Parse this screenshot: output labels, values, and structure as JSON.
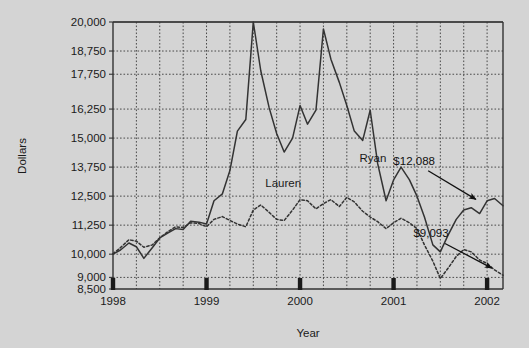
{
  "chart_data": {
    "type": "line",
    "title": "",
    "xlabel": "Year",
    "ylabel": "Dollars",
    "xlim": [
      1998.0,
      2002.17
    ],
    "ylim": [
      8500,
      20000
    ],
    "grid": true,
    "legend": "inline-labels",
    "y_ticks": [
      8500,
      9000,
      10000,
      11250,
      12500,
      13750,
      15000,
      16250,
      17750,
      18750,
      20000
    ],
    "y_tick_labels": [
      "8,500",
      "9,000",
      "10,000",
      "11,250",
      "12,500",
      "13,750",
      "15,000",
      "16,250",
      "17,750",
      "18,750",
      "20,000"
    ],
    "x_ticks": [
      1998,
      1999,
      2000,
      2001,
      2002
    ],
    "x_tick_labels": [
      "1998",
      "1999",
      "2000",
      "2001",
      "2002"
    ],
    "x_minor_interval": 0.25,
    "series": [
      {
        "name": "Ryan",
        "style": "solid",
        "color": "#333333",
        "label_x": 2000.78,
        "label_y": 13980,
        "end_value": 12088,
        "end_label": "$12,088",
        "x": [
          1998.0,
          1998.08,
          1998.17,
          1998.25,
          1998.33,
          1998.42,
          1998.5,
          1998.58,
          1998.67,
          1998.75,
          1998.83,
          1998.92,
          1999.0,
          1999.08,
          1999.17,
          1999.25,
          1999.33,
          1999.42,
          1999.5,
          1999.58,
          1999.67,
          1999.75,
          1999.83,
          1999.92,
          2000.0,
          2000.08,
          2000.17,
          2000.25,
          2000.33,
          2000.42,
          2000.5,
          2000.58,
          2000.67,
          2000.75,
          2000.83,
          2000.92,
          2001.0,
          2001.08,
          2001.17,
          2001.25,
          2001.33,
          2001.42,
          2001.5,
          2001.58,
          2001.67,
          2001.75,
          2001.83,
          2001.92,
          2002.0,
          2002.08,
          2002.17
        ],
        "y": [
          10000,
          10180,
          10480,
          10320,
          9820,
          10280,
          10700,
          10900,
          11100,
          11060,
          11420,
          11380,
          11300,
          12300,
          12600,
          13600,
          15300,
          15800,
          20000,
          17900,
          16300,
          15200,
          14400,
          15000,
          16400,
          15600,
          16200,
          19700,
          18400,
          17400,
          16400,
          15300,
          14900,
          16200,
          13900,
          12300,
          13200,
          13750,
          13200,
          12500,
          11600,
          10400,
          10100,
          10800,
          11500,
          11900,
          12000,
          11750,
          12300,
          12400,
          12088
        ]
      },
      {
        "name": "Lauren",
        "style": "dotted",
        "color": "#333333",
        "label_x": 1999.82,
        "label_y": 12880,
        "end_value": 9093,
        "end_label": "$9,093",
        "x": [
          1998.0,
          1998.08,
          1998.17,
          1998.25,
          1998.33,
          1998.42,
          1998.5,
          1998.58,
          1998.67,
          1998.75,
          1998.83,
          1998.92,
          1999.0,
          1999.08,
          1999.17,
          1999.25,
          1999.33,
          1999.42,
          1999.5,
          1999.58,
          1999.67,
          1999.75,
          1999.83,
          1999.92,
          2000.0,
          2000.08,
          2000.17,
          2000.25,
          2000.33,
          2000.42,
          2000.5,
          2000.58,
          2000.67,
          2000.75,
          2000.83,
          2000.92,
          2001.0,
          2001.08,
          2001.17,
          2001.25,
          2001.33,
          2001.42,
          2001.5,
          2001.58,
          2001.67,
          2001.75,
          2001.83,
          2001.92,
          2002.0,
          2002.08,
          2002.17
        ],
        "y": [
          10020,
          10280,
          10620,
          10560,
          10300,
          10400,
          10700,
          10950,
          11180,
          11150,
          11350,
          11320,
          11180,
          11500,
          11620,
          11450,
          11300,
          11180,
          11900,
          12120,
          11800,
          11500,
          11450,
          11900,
          12350,
          12300,
          11950,
          12180,
          12350,
          12050,
          12450,
          12250,
          11850,
          11600,
          11400,
          11100,
          11350,
          11550,
          11350,
          11100,
          10400,
          9700,
          8950,
          9380,
          9900,
          10200,
          10100,
          9750,
          9600,
          9320,
          9093
        ]
      }
    ],
    "annotations": [
      {
        "text": "$12,088",
        "text_x": 2001.22,
        "text_y": 13850,
        "arrow_to_x": 2001.88,
        "arrow_to_y": 12360
      },
      {
        "text": "$9,093",
        "text_x": 2001.4,
        "text_y": 10720,
        "arrow_to_x": 2002.05,
        "arrow_to_y": 9400
      }
    ]
  },
  "theme": {
    "background": "#d4d4d4",
    "plot_background": "#d4d4d4",
    "axis_color": "#333333",
    "grid_color": "#4a4a4a",
    "text_color": "#1a1a1a"
  }
}
